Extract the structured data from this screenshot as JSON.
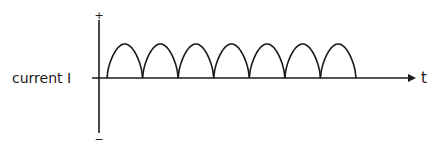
{
  "diagram": {
    "y_axis": {
      "label": "current I",
      "plus_sign": "+",
      "minus_sign": "−"
    },
    "x_axis": {
      "label": "t"
    },
    "waveform": {
      "type": "rectified-half-sine-arches",
      "arch_count": 7,
      "color": "#1a1a1a"
    }
  }
}
